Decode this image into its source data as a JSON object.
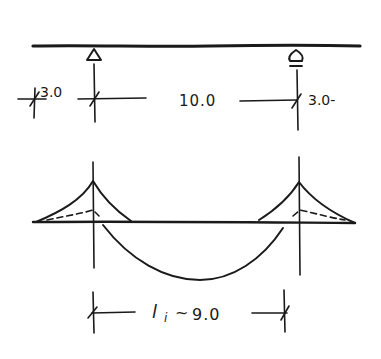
{
  "diagram": {
    "type": "hand-drawn structural sketch",
    "beam": {
      "supports": [
        "left-pin-support",
        "right-roller-support"
      ]
    },
    "dimensions": {
      "left_overhang": "3.0",
      "span": "10.0",
      "right_overhang": "3.0-",
      "effective_span": "l",
      "effective_span_sub": "i",
      "effective_span_approx": "~",
      "effective_span_value": "9.0"
    },
    "colors": {
      "ink": "#1a1a1a",
      "background": "#ffffff"
    }
  }
}
